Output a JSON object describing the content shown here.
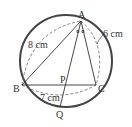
{
  "diagram": {
    "points": {
      "A": {
        "label": "A"
      },
      "B": {
        "label": "B"
      },
      "C": {
        "label": "C"
      },
      "P": {
        "label": "P"
      },
      "Q": {
        "label": "Q"
      }
    },
    "lengths": {
      "AB": "8 cm",
      "AC": "6 cm",
      "BP": "7 cm"
    },
    "angle_marks": "∘"
  }
}
